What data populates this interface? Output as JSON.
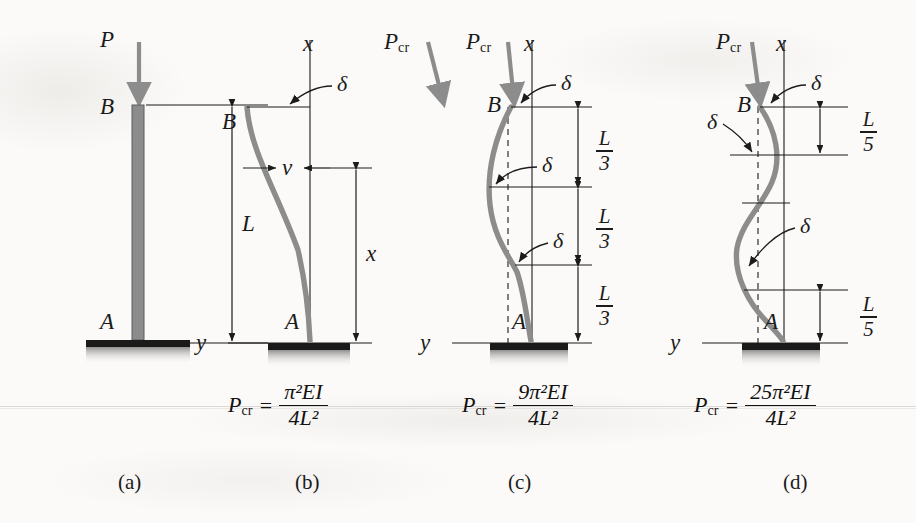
{
  "figure": {
    "background_color": "#fbfaf8",
    "ink_color": "#1b1b1b",
    "member_color": "#8c8c8c",
    "support_color": "#1a1a1a"
  },
  "panels": [
    {
      "id": "a",
      "caption": "(a)",
      "load_label": "P",
      "load_sub": "",
      "top_node": "B",
      "bottom_node": "A",
      "dimension_label": "L",
      "axis_x": "",
      "axis_y": "",
      "deflection_labels": [],
      "formula": null,
      "mode": "straight"
    },
    {
      "id": "b",
      "caption": "(b)",
      "load_label": "P",
      "load_sub": "cr",
      "top_node": "B",
      "bottom_node": "A",
      "dimension_label": "x",
      "axis_x": "x",
      "axis_y": "y",
      "deflection_labels": [
        "δ",
        "v"
      ],
      "formula": {
        "lhs": "P",
        "lhs_sub": "cr",
        "eq": "=",
        "numerator_coeff": "",
        "numerator": "π²EI",
        "denominator": "4L²"
      },
      "mode": "first"
    },
    {
      "id": "c",
      "caption": "(c)",
      "load_label": "P",
      "load_sub": "cr",
      "top_node": "B",
      "bottom_node": "A",
      "segment_label_numerator": "L",
      "segment_label_denominator": "3",
      "segment_count": 3,
      "axis_x": "x",
      "axis_y": "y",
      "deflection_labels": [
        "δ",
        "δ",
        "δ"
      ],
      "formula": {
        "lhs": "P",
        "lhs_sub": "cr",
        "eq": "=",
        "numerator_coeff": "9",
        "numerator": "π²EI",
        "denominator": "4L²"
      },
      "mode": "second"
    },
    {
      "id": "d",
      "caption": "(d)",
      "load_label": "P",
      "load_sub": "cr",
      "top_node": "B",
      "bottom_node": "A",
      "segment_label_numerator": "L",
      "segment_label_denominator": "5",
      "segment_count": 5,
      "axis_x": "x",
      "axis_y": "y",
      "deflection_labels": [
        "δ",
        "δ",
        "δ"
      ],
      "formula": {
        "lhs": "P",
        "lhs_sub": "cr",
        "eq": "=",
        "numerator_coeff": "25",
        "numerator": "π²EI",
        "denominator": "4L²"
      },
      "mode": "third"
    }
  ],
  "glyphs": {
    "delta": "δ",
    "pi": "π",
    "v": "v",
    "x": "x",
    "y": "y",
    "L": "L",
    "A": "A",
    "B": "B",
    "equals": "=",
    "EI": "EI"
  },
  "formula_numerators": {
    "b": "π",
    "c": "9π",
    "d": "25π"
  }
}
